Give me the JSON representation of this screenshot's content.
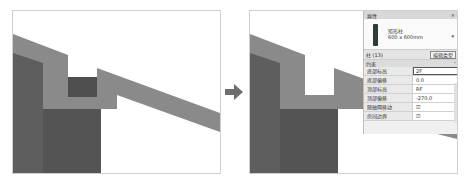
{
  "before_view": {
    "description": "3D view of roof slab intersecting column (before)"
  },
  "transition": {
    "icon": "arrow-right-icon"
  },
  "after_view": {
    "properties_panel": {
      "title": "属性",
      "close_icon": "×",
      "type_name": "矩形柱",
      "type_size": "600 x 600mm",
      "selector": "柱 (13)",
      "edit_type_label": "编辑类型",
      "section": "约束",
      "rows": [
        {
          "label": "底部标高",
          "value": "2F"
        },
        {
          "label": "底部偏移",
          "value": "0.0"
        },
        {
          "label": "顶部标高",
          "value": "RF"
        },
        {
          "label": "顶部偏移",
          "value": "-270.0"
        },
        {
          "label": "随轴网移动",
          "value": "☑"
        },
        {
          "label": "房间边界",
          "value": "☑"
        }
      ]
    }
  },
  "colors": {
    "column_dark": "#5c5c5c",
    "column_mid": "#6a6a6a",
    "roof": "#8a8a8a",
    "notch_dark": "#4a4a4a",
    "arrow": "#6e6e6e"
  }
}
